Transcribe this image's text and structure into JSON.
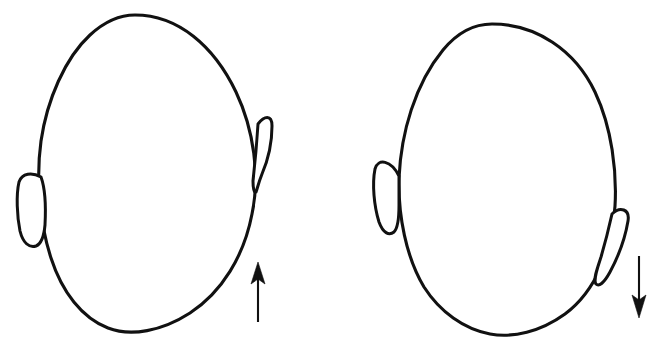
{
  "figure": {
    "background_color": "#ffffff",
    "line_color": "#111111",
    "width": 661,
    "height": 354,
    "panel_count": 2
  },
  "panels": [
    {
      "id": "left-panel",
      "label": "Left head diagram",
      "head": {
        "name": "head-outline-left",
        "description": "Oval head outline tilted counter-clockwise, apex left of center",
        "apex": [
          135,
          15
        ],
        "chin": [
          125,
          333
        ],
        "leftmost_x": 40,
        "rightmost_x": 252,
        "path": "M 135 15 C 178 15 214 46 236 92 C 254 130 260 176 252 214 C 244 256 222 292 190 313 C 162 331 131 337 108 328 C 82 318 62 292 51 258 C 39 221 36 177 41 141 C 47 100 65 58 90 35 C 103 23 119 15 135 15 Z"
      },
      "ears": [
        {
          "name": "ear-left-lower",
          "side": "left",
          "description": "Narrow vertical ear on the left edge, positioned low",
          "top_y": 170,
          "bottom_y": 245,
          "path": "M 41 177 C 32 172 22 173 19 182 C 16 195 17 216 20 231 C 23 243 29 248 36 246 C 41 244 44 236 45 225 C 46 206 45 188 41 177 Z"
        },
        {
          "name": "ear-right-upper",
          "side": "right",
          "description": "Narrow vertical ear on the right edge, positioned high",
          "top_y": 115,
          "bottom_y": 192,
          "path": "M 258 124 C 264 116 272 114 272 126 C 272 143 268 160 262 174 C 258 184 257 190 256 192 C 254 193 253 188 253 181 C 255 163 257 140 258 124 Z"
        }
      ],
      "arrow": {
        "name": "arrow-up",
        "direction": "up",
        "meaning": "ear displaced upward",
        "shaft": {
          "x": 258,
          "y_start": 322,
          "y_end": 276
        },
        "head_points": "258,262 265,284 258,279 251,284"
      }
    },
    {
      "id": "right-panel",
      "label": "Right head diagram",
      "head": {
        "name": "head-outline-right",
        "description": "Upright symmetric oval head outline",
        "apex": [
          492,
          24
        ],
        "chin": [
          492,
          334
        ],
        "leftmost_x": 398,
        "rightmost_x": 616,
        "path": "M 492 24 C 536 24 575 50 595 92 C 612 128 617 172 615 206 C 612 250 596 291 565 314 C 540 332 513 338 490 334 C 464 329 440 312 424 287 C 406 257 398 215 399 178 C 401 133 415 84 443 50 C 457 33 474 24 492 24 Z"
      },
      "ears": [
        {
          "name": "ear-left-upper",
          "side": "left",
          "description": "Narrow vertical ear on the left edge, positioned high",
          "top_y": 158,
          "bottom_y": 233,
          "path": "M 399 176 C 391 160 378 158 375 169 C 372 184 374 206 379 222 C 383 233 389 236 394 232 C 398 228 399 218 399 205 C 399 192 399 182 399 176 Z"
        },
        {
          "name": "ear-right-lower-tilted",
          "side": "right",
          "description": "Tilted ear on the right edge, slanting down and to the left, positioned low",
          "top_y": 206,
          "bottom_y": 285,
          "path": "M 612 214 C 620 206 630 209 628 221 C 625 239 617 259 610 272 C 604 283 599 287 596 284 C 593 280 597 269 601 257 C 606 240 610 223 612 214 Z"
        }
      ],
      "arrow": {
        "name": "arrow-down",
        "direction": "down",
        "meaning": "ear displaced downward",
        "shaft": {
          "x": 639,
          "y_start": 256,
          "y_end": 300
        },
        "head_points": "639,318 632,295 639,300 646,295"
      }
    }
  ]
}
